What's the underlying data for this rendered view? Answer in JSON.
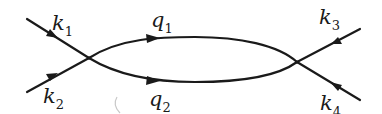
{
  "diagram": {
    "type": "feynman-one-loop",
    "vertices": [
      {
        "id": "left-vertex",
        "x": 89,
        "y": 58
      },
      {
        "id": "right-vertex",
        "x": 297,
        "y": 62
      }
    ],
    "external_lines": [
      {
        "id": "k1",
        "label": "k",
        "subscript": "1",
        "direction": "incoming"
      },
      {
        "id": "k2",
        "label": "k",
        "subscript": "2",
        "direction": "incoming"
      },
      {
        "id": "k3",
        "label": "k",
        "subscript": "3",
        "direction": "incoming"
      },
      {
        "id": "k4",
        "label": "k",
        "subscript": "4",
        "direction": "incoming"
      }
    ],
    "internal_lines": [
      {
        "id": "q1",
        "label": "q",
        "subscript": "1",
        "direction": "left-to-right"
      },
      {
        "id": "q2",
        "label": "q",
        "subscript": "2",
        "direction": "left-to-right"
      }
    ]
  },
  "labels": {
    "k1": {
      "base": "k",
      "sub": "1"
    },
    "k2": {
      "base": "k",
      "sub": "2"
    },
    "k3": {
      "base": "k",
      "sub": "3"
    },
    "k4": {
      "base": "k",
      "sub": "4"
    },
    "q1": {
      "base": "q",
      "sub": "1"
    },
    "q2": {
      "base": "q",
      "sub": "2"
    }
  },
  "colors": {
    "line": "#1a1a1a",
    "background": "#ffffff"
  }
}
